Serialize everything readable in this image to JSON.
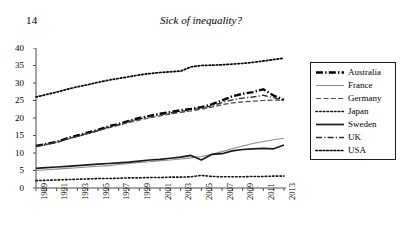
{
  "page": {
    "folio": "14",
    "running_title": "Sick of inequality?"
  },
  "legend": {
    "position": "right",
    "items": [
      {
        "label": "Australia",
        "style": "thick-dash-dot",
        "color": "#000000"
      },
      {
        "label": "France",
        "style": "thin-solid",
        "color": "#808080"
      },
      {
        "label": "Germany",
        "style": "dashed",
        "color": "#555555"
      },
      {
        "label": "Japan",
        "style": "dotted",
        "color": "#000000"
      },
      {
        "label": "Sweden",
        "style": "solid",
        "color": "#1a1a1a"
      },
      {
        "label": "UK",
        "style": "dash-dot",
        "color": "#333333"
      },
      {
        "label": "USA",
        "style": "fine-dotted",
        "color": "#000000"
      }
    ]
  },
  "chart_data": {
    "type": "line",
    "title": "",
    "xlabel": "",
    "ylabel": "",
    "xlim": [
      1989,
      2013
    ],
    "ylim": [
      0,
      40
    ],
    "yticks": [
      0,
      5,
      10,
      15,
      20,
      25,
      30,
      35,
      40
    ],
    "grid": false,
    "x": [
      1989,
      1990,
      1991,
      1992,
      1993,
      1994,
      1995,
      1996,
      1997,
      1998,
      1999,
      2000,
      2001,
      2002,
      2003,
      2004,
      2005,
      2006,
      2007,
      2008,
      2009,
      2010,
      2011,
      2012,
      2013
    ],
    "xtick_labels": [
      "1989",
      "",
      "1991",
      "",
      "1993",
      "",
      "1995",
      "",
      "1997",
      "",
      "1999",
      "",
      "2001",
      "",
      "2003",
      "",
      "2005",
      "",
      "2007",
      "",
      "2009",
      "",
      "2011",
      "",
      "2013"
    ],
    "series": [
      {
        "name": "Australia",
        "values": [
          12.0,
          12.6,
          13.2,
          14.2,
          15.0,
          15.8,
          16.6,
          17.6,
          18.3,
          19.2,
          20.0,
          20.6,
          21.2,
          21.7,
          22.2,
          22.6,
          23.1,
          23.9,
          25.0,
          26.2,
          26.9,
          27.4,
          28.2,
          26.4,
          25.2
        ]
      },
      {
        "name": "France",
        "values": [
          5.0,
          5.2,
          5.4,
          5.6,
          5.8,
          6.0,
          6.2,
          6.4,
          6.7,
          7.0,
          7.3,
          7.5,
          7.8,
          8.0,
          8.3,
          8.6,
          9.0,
          9.6,
          10.4,
          11.2,
          12.0,
          12.7,
          13.3,
          13.8,
          14.2
        ]
      },
      {
        "name": "Germany",
        "values": [
          11.8,
          12.4,
          13.0,
          13.9,
          14.7,
          15.5,
          16.3,
          17.2,
          17.9,
          18.7,
          19.4,
          20.0,
          20.6,
          21.1,
          21.6,
          22.0,
          22.5,
          23.1,
          23.8,
          24.3,
          24.6,
          24.8,
          25.0,
          25.1,
          25.1
        ]
      },
      {
        "name": "Japan",
        "values": [
          2.1,
          2.2,
          2.3,
          2.4,
          2.5,
          2.6,
          2.7,
          2.7,
          2.8,
          2.9,
          2.9,
          3.0,
          3.0,
          3.1,
          3.1,
          3.2,
          3.6,
          3.3,
          3.2,
          3.2,
          3.2,
          3.3,
          3.3,
          3.4,
          3.4
        ]
      },
      {
        "name": "Sweden",
        "values": [
          5.6,
          5.8,
          6.0,
          6.2,
          6.4,
          6.6,
          6.8,
          7.0,
          7.2,
          7.4,
          7.7,
          8.0,
          8.2,
          8.5,
          8.8,
          9.3,
          8.0,
          9.6,
          9.8,
          10.6,
          11.0,
          11.2,
          11.3,
          11.2,
          12.3
        ]
      },
      {
        "name": "UK",
        "values": [
          11.9,
          12.5,
          13.1,
          14.0,
          14.8,
          15.6,
          16.4,
          17.4,
          18.1,
          19.0,
          19.7,
          20.3,
          20.9,
          21.4,
          21.9,
          22.3,
          22.8,
          23.5,
          24.4,
          25.2,
          25.7,
          26.0,
          26.5,
          25.8,
          25.0
        ]
      },
      {
        "name": "USA",
        "values": [
          26.0,
          26.7,
          27.4,
          28.2,
          28.9,
          29.5,
          30.2,
          30.8,
          31.3,
          31.8,
          32.3,
          32.7,
          33.0,
          33.2,
          33.4,
          34.6,
          35.0,
          35.1,
          35.2,
          35.4,
          35.6,
          35.9,
          36.3,
          36.7,
          37.1
        ]
      }
    ]
  }
}
